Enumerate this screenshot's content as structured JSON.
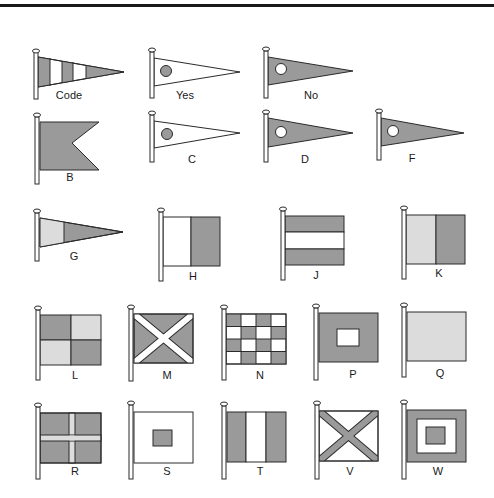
{
  "colors": {
    "dark": "#9a9a9a",
    "light": "#dcdcdc",
    "white": "#ffffff",
    "stroke": "#2a2a2a"
  },
  "flags": [
    {
      "id": "code",
      "label": "Code",
      "shape": "pennant",
      "pattern": "vertical stripes dark-white-dark-white-dark"
    },
    {
      "id": "yes",
      "label": "Yes",
      "shape": "pennant",
      "pattern": "white with dark circle"
    },
    {
      "id": "no",
      "label": "No",
      "shape": "pennant",
      "pattern": "dark with white circle"
    },
    {
      "id": "b",
      "label": "B",
      "shape": "swallowtail",
      "pattern": "solid dark"
    },
    {
      "id": "c",
      "label": "C",
      "shape": "pennant",
      "pattern": "white with dark circle"
    },
    {
      "id": "d",
      "label": "D",
      "shape": "pennant",
      "pattern": "dark with white circle"
    },
    {
      "id": "f",
      "label": "F",
      "shape": "pennant",
      "pattern": "dark with white circle"
    },
    {
      "id": "g",
      "label": "G",
      "shape": "pennant",
      "pattern": "light hoist, dark fly"
    },
    {
      "id": "h",
      "label": "H",
      "shape": "rectangle",
      "pattern": "white hoist, dark fly"
    },
    {
      "id": "j",
      "label": "J",
      "shape": "rectangle",
      "pattern": "dark-white-dark horizontal"
    },
    {
      "id": "k",
      "label": "K",
      "shape": "rectangle",
      "pattern": "light hoist, dark fly"
    },
    {
      "id": "l",
      "label": "L",
      "shape": "rectangle",
      "pattern": "quartered dark/light"
    },
    {
      "id": "m",
      "label": "M",
      "shape": "rectangle",
      "pattern": "dark with white saltire"
    },
    {
      "id": "n",
      "label": "N",
      "shape": "rectangle",
      "pattern": "4x4 checker"
    },
    {
      "id": "p",
      "label": "P",
      "shape": "rectangle",
      "pattern": "dark with white square"
    },
    {
      "id": "q",
      "label": "Q",
      "shape": "rectangle",
      "pattern": "solid light"
    },
    {
      "id": "r",
      "label": "R",
      "shape": "rectangle",
      "pattern": "dark with light cross"
    },
    {
      "id": "s",
      "label": "S",
      "shape": "rectangle",
      "pattern": "white with dark square"
    },
    {
      "id": "t",
      "label": "T",
      "shape": "rectangle",
      "pattern": "dark-white-dark vertical"
    },
    {
      "id": "v",
      "label": "V",
      "shape": "rectangle",
      "pattern": "white with dark saltire"
    },
    {
      "id": "w",
      "label": "W",
      "shape": "rectangle",
      "pattern": "dark border, white ring, dark center"
    }
  ]
}
